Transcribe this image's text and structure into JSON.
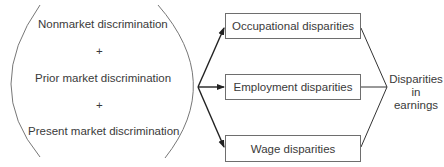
{
  "causes": {
    "items": [
      "Nonmarket discrimination",
      "Prior market discrimination",
      "Present market discrimination"
    ],
    "operator": "+"
  },
  "disparities": {
    "boxes": [
      "Occupational disparities",
      "Employment disparities",
      "Wage disparities"
    ]
  },
  "outcome": {
    "line1": "Disparities",
    "line2": "in",
    "line3": "earnings"
  },
  "colors": {
    "stroke": "#333333",
    "text": "#3a3a3a"
  }
}
